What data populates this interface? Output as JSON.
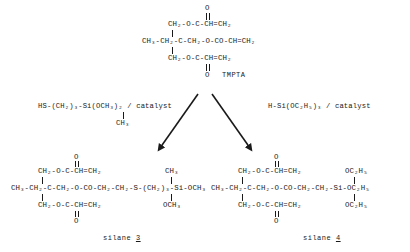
{
  "scheme": {
    "background_color": "#ffffff",
    "ink_color": "#1a1a1a"
  },
  "reactant": {
    "name": "TMPTA",
    "top_oxygen": "O",
    "top_branch": "CH₂-O-C-CH=CH₂",
    "main_chain": "CH₃-CH₂-C-CH₂-O-CO-CH=CH₂",
    "bottom_branch": "CH₂-O-C-CH=CH₂",
    "bottom_oxygen": "O"
  },
  "reagents": {
    "left": {
      "main": "HS-(CH₂)₃-Si(OCH₃)₂ / catalyst",
      "substituent": "CH₃"
    },
    "right": {
      "main": "H-Si(OC₂H₅)₃ / catalyst"
    }
  },
  "products": {
    "left": {
      "label_prefix": "silane ",
      "label_number": "3",
      "top_oxygen": "O",
      "top_branch": "CH₂-O-C-CH=CH₂",
      "main_chain": "CH₃-CH₂-C-CH₂-O-CO-CH₂-CH₂-S-(CH₂)₃-Si-OCH₃",
      "bottom_branch": "CH₂-O-C-CH=CH₂",
      "bottom_oxygen": "O",
      "silicon_top_group": "CH₃",
      "silicon_bottom_group": "OCH₃"
    },
    "right": {
      "label_prefix": "silane ",
      "label_number": "4",
      "top_oxygen": "O",
      "top_branch": "CH₂-O-C-CH=CH₂",
      "main_chain": "CH₃-CH₂-C-CH₂-O-CO-CH₂-CH₂-Si-OC₂H₅",
      "bottom_branch": "CH₂-O-C-CH=CH₂",
      "bottom_oxygen": "O",
      "silicon_top_group": "OC₂H₅",
      "silicon_bottom_group": "OC₂H₅"
    }
  },
  "arrows": {
    "left_arrow": "arrow-to-silane-3",
    "right_arrow": "arrow-to-silane-4"
  }
}
